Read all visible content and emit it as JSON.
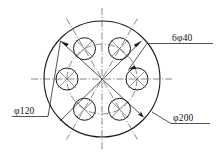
{
  "drawing": {
    "title": "Circular flange plate with six equally spaced holes",
    "background_color": "#ffffff",
    "line_color": "#1a1a1a",
    "centerline_color": "#555555",
    "canvas": {
      "width": 219,
      "height": 159
    }
  },
  "geometry": {
    "center": {
      "x": 102,
      "y": 79
    },
    "outer_circle": {
      "radius_px": 58,
      "diameter_label": "200"
    },
    "bolt_circle": {
      "radius_px": 35,
      "diameter_label": "120",
      "linetype": "dash-dot"
    },
    "holes": {
      "count": 6,
      "radius_px": 11,
      "diameter_label": "40",
      "angles_deg": [
        0,
        60,
        120,
        180,
        240,
        300
      ]
    }
  },
  "dimensions": [
    {
      "id": "holes-dimension",
      "text": "6φ40",
      "quantity": "6",
      "symbol": "φ",
      "value": "40",
      "position": "upper-right",
      "has_underline": true,
      "leader": "points to one bolt hole"
    },
    {
      "id": "bolt-circle-dimension",
      "text": "φ120",
      "quantity": "",
      "symbol": "φ",
      "value": "120",
      "position": "lower-left",
      "has_underline": true,
      "leader": "points to bolt circle"
    },
    {
      "id": "outer-diameter-dimension",
      "text": "φ200",
      "quantity": "",
      "symbol": "φ",
      "value": "200",
      "position": "lower-right",
      "has_underline": true,
      "leader": "points to outer circle"
    }
  ],
  "labels": {
    "holes": "6φ40",
    "bolt_circle": "φ120",
    "outer_diameter": "φ200"
  }
}
